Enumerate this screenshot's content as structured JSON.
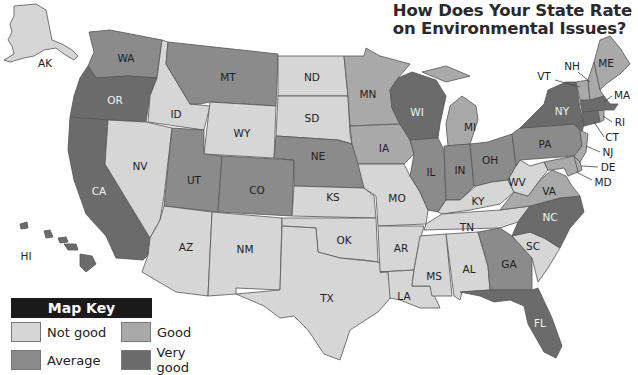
{
  "title": {
    "line1": "How Does Your State Rate",
    "line2": "on Environmental Issues?"
  },
  "colors": {
    "not_good": "#d6d6d6",
    "good": "#a9a9a9",
    "average": "#8b8b8b",
    "very_good": "#6b6b6b"
  },
  "map_key": {
    "title": "Map Key",
    "items": [
      {
        "label": "Not good",
        "color": "#d6d6d6"
      },
      {
        "label": "Good",
        "color": "#a9a9a9"
      },
      {
        "label": "Average",
        "color": "#8b8b8b"
      },
      {
        "label": "Very good",
        "color": "#6b6b6b"
      }
    ]
  },
  "states": {
    "AK": {
      "label": "AK",
      "rating": "Not good"
    },
    "HI": {
      "label": "HI",
      "rating": "Very good"
    },
    "WA": {
      "label": "WA",
      "rating": "Average"
    },
    "OR": {
      "label": "OR",
      "rating": "Very good"
    },
    "CA": {
      "label": "CA",
      "rating": "Very good"
    },
    "ID": {
      "label": "ID",
      "rating": "Not good"
    },
    "NV": {
      "label": "NV",
      "rating": "Not good"
    },
    "MT": {
      "label": "MT",
      "rating": "Average"
    },
    "WY": {
      "label": "WY",
      "rating": "Not good"
    },
    "UT": {
      "label": "UT",
      "rating": "Average"
    },
    "CO": {
      "label": "CO",
      "rating": "Average"
    },
    "AZ": {
      "label": "AZ",
      "rating": "Not good"
    },
    "NM": {
      "label": "NM",
      "rating": "Not good"
    },
    "ND": {
      "label": "ND",
      "rating": "Not good"
    },
    "SD": {
      "label": "SD",
      "rating": "Not good"
    },
    "NE": {
      "label": "NE",
      "rating": "Average"
    },
    "KS": {
      "label": "KS",
      "rating": "Not good"
    },
    "OK": {
      "label": "OK",
      "rating": "Not good"
    },
    "TX": {
      "label": "TX",
      "rating": "Not good"
    },
    "MN": {
      "label": "MN",
      "rating": "Good"
    },
    "IA": {
      "label": "IA",
      "rating": "Good"
    },
    "MO": {
      "label": "MO",
      "rating": "Not good"
    },
    "AR": {
      "label": "AR",
      "rating": "Not good"
    },
    "LA": {
      "label": "LA",
      "rating": "Not good"
    },
    "WI": {
      "label": "WI",
      "rating": "Very good"
    },
    "IL": {
      "label": "IL",
      "rating": "Average"
    },
    "MI": {
      "label": "MI",
      "rating": "Good"
    },
    "IN": {
      "label": "IN",
      "rating": "Average"
    },
    "OH": {
      "label": "OH",
      "rating": "Average"
    },
    "KY": {
      "label": "KY",
      "rating": "Not good"
    },
    "TN": {
      "label": "TN",
      "rating": "Not good"
    },
    "MS": {
      "label": "MS",
      "rating": "Not good"
    },
    "AL": {
      "label": "AL",
      "rating": "Not good"
    },
    "GA": {
      "label": "GA",
      "rating": "Average"
    },
    "FL": {
      "label": "FL",
      "rating": "Very good"
    },
    "SC": {
      "label": "SC",
      "rating": "Not good"
    },
    "NC": {
      "label": "NC",
      "rating": "Very good"
    },
    "VA": {
      "label": "VA",
      "rating": "Good"
    },
    "WV": {
      "label": "WV",
      "rating": "Not good"
    },
    "PA": {
      "label": "PA",
      "rating": "Average"
    },
    "NY": {
      "label": "NY",
      "rating": "Very good"
    },
    "NJ": {
      "label": "NJ",
      "rating": "Good"
    },
    "DE": {
      "label": "DE",
      "rating": "Good"
    },
    "MD": {
      "label": "MD",
      "rating": "Good"
    },
    "CT": {
      "label": "CT",
      "rating": "Very good"
    },
    "RI": {
      "label": "RI",
      "rating": "Good"
    },
    "MA": {
      "label": "MA",
      "rating": "Very good"
    },
    "VT": {
      "label": "VT",
      "rating": "Good"
    },
    "NH": {
      "label": "NH",
      "rating": "Good"
    },
    "ME": {
      "label": "ME",
      "rating": "Good"
    }
  }
}
